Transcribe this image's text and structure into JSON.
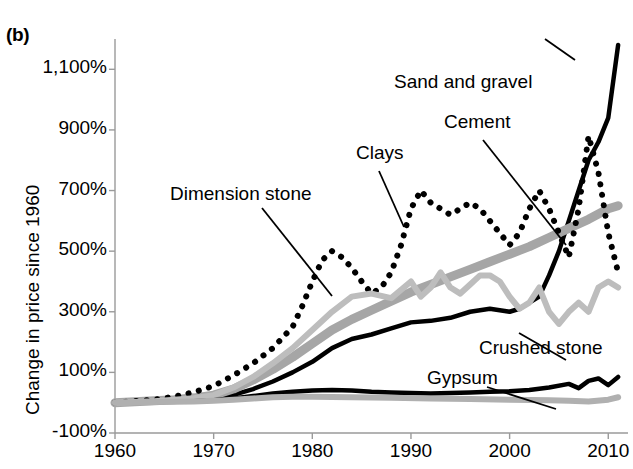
{
  "figure": {
    "panel_label": "(b)",
    "ylabel": "Change in price since 1960"
  },
  "chart_data": {
    "type": "line",
    "title": "",
    "xlabel": "",
    "ylabel": "Change in price since 1960",
    "xlim": [
      1960,
      2012
    ],
    "ylim": [
      -100,
      1200
    ],
    "yticks": [
      "-100%",
      "100%",
      "300%",
      "500%",
      "700%",
      "900%",
      "1,100%"
    ],
    "ytick_values": [
      -100,
      100,
      300,
      500,
      700,
      900,
      1100
    ],
    "xticks": [
      "1960",
      "1970",
      "1980",
      "1990",
      "2000",
      "2010"
    ],
    "xtick_values": [
      1960,
      1970,
      1980,
      1990,
      2000,
      2010
    ],
    "grid": false,
    "legend_position": "inline-annotations",
    "annotations": [
      {
        "text": "Dimension stone",
        "x_px": 170,
        "y_px": 196
      },
      {
        "text": "Clays",
        "x_px": 356,
        "y_px": 155
      },
      {
        "text": "Sand and gravel",
        "x_px": 394,
        "y_px": 84
      },
      {
        "text": "Cement",
        "x_px": 444,
        "y_px": 124
      },
      {
        "text": "Crushed stone",
        "x_px": 479,
        "y_px": 350
      },
      {
        "text": "Gypsum",
        "x_px": 427,
        "y_px": 380
      }
    ],
    "series": [
      {
        "name": "Cement",
        "style": "solid",
        "color": "#000000",
        "width": 4.5,
        "x": [
          1960,
          1962,
          1964,
          1966,
          1968,
          1970,
          1972,
          1974,
          1976,
          1978,
          1980,
          1982,
          1984,
          1986,
          1988,
          1990,
          1992,
          1994,
          1996,
          1998,
          2000,
          2001,
          2002,
          2003,
          2004,
          2005,
          2006,
          2007,
          2008,
          2009,
          2010,
          2011
        ],
        "values": [
          0,
          2,
          4,
          6,
          10,
          16,
          26,
          45,
          70,
          100,
          135,
          180,
          210,
          225,
          245,
          265,
          270,
          280,
          300,
          310,
          300,
          310,
          330,
          350,
          420,
          500,
          600,
          700,
          800,
          860,
          940,
          1180
        ]
      },
      {
        "name": "Sand and gravel",
        "style": "solid",
        "color": "#a6a6a6",
        "width": 9,
        "x": [
          1960,
          1962,
          1964,
          1966,
          1968,
          1970,
          1972,
          1974,
          1976,
          1978,
          1980,
          1982,
          1984,
          1986,
          1988,
          1990,
          1992,
          1994,
          1996,
          1998,
          2000,
          2002,
          2004,
          2006,
          2008,
          2010,
          2011
        ],
        "values": [
          0,
          3,
          6,
          10,
          16,
          25,
          45,
          75,
          110,
          150,
          195,
          240,
          275,
          305,
          335,
          365,
          390,
          415,
          440,
          465,
          490,
          515,
          545,
          575,
          605,
          640,
          650
        ]
      },
      {
        "name": "Clays",
        "style": "dotted",
        "color": "#000000",
        "width": 6,
        "x": [
          1960,
          1962,
          1964,
          1966,
          1968,
          1970,
          1972,
          1974,
          1976,
          1978,
          1979,
          1980,
          1981,
          1982,
          1983,
          1984,
          1985,
          1986,
          1987,
          1988,
          1989,
          1990,
          1991,
          1992,
          1993,
          1994,
          1995,
          1996,
          1997,
          1998,
          1999,
          2000,
          2001,
          2002,
          2003,
          2004,
          2005,
          2006,
          2007,
          2008,
          2009,
          2010,
          2011
        ],
        "values": [
          0,
          5,
          10,
          20,
          35,
          55,
          90,
          130,
          180,
          250,
          320,
          400,
          470,
          500,
          480,
          445,
          400,
          360,
          380,
          430,
          520,
          640,
          700,
          660,
          640,
          620,
          640,
          660,
          640,
          600,
          560,
          520,
          560,
          640,
          700,
          640,
          560,
          480,
          640,
          880,
          760,
          560,
          430
        ]
      },
      {
        "name": "Dimension stone",
        "style": "solid",
        "color": "#bdbdbd",
        "width": 6,
        "x": [
          1960,
          1964,
          1968,
          1970,
          1972,
          1974,
          1976,
          1978,
          1980,
          1982,
          1984,
          1986,
          1988,
          1990,
          1991,
          1992,
          1993,
          1994,
          1995,
          1996,
          1997,
          1998,
          1999,
          2000,
          2001,
          2002,
          2003,
          2004,
          2005,
          2006,
          2007,
          2008,
          2009,
          2010,
          2011
        ],
        "values": [
          0,
          5,
          15,
          25,
          50,
          85,
          130,
          180,
          240,
          300,
          350,
          360,
          345,
          400,
          350,
          380,
          430,
          380,
          360,
          390,
          420,
          420,
          400,
          350,
          310,
          330,
          380,
          300,
          260,
          300,
          330,
          300,
          380,
          400,
          380
        ]
      },
      {
        "name": "Crushed stone",
        "style": "solid",
        "color": "#000000",
        "width": 4.5,
        "x": [
          1960,
          1964,
          1968,
          1970,
          1972,
          1974,
          1976,
          1978,
          1980,
          1982,
          1984,
          1986,
          1988,
          1990,
          1992,
          1994,
          1996,
          1998,
          2000,
          2002,
          2004,
          2006,
          2007,
          2008,
          2009,
          2010,
          2011
        ],
        "values": [
          0,
          2,
          5,
          8,
          14,
          22,
          30,
          36,
          40,
          42,
          40,
          36,
          34,
          32,
          30,
          32,
          34,
          36,
          38,
          42,
          50,
          62,
          48,
          72,
          80,
          58,
          85
        ]
      },
      {
        "name": "Gypsum",
        "style": "solid",
        "color": "#b0b0b0",
        "width": 6,
        "x": [
          1960,
          1964,
          1968,
          1970,
          1972,
          1974,
          1976,
          1978,
          1980,
          1984,
          1988,
          1992,
          1996,
          2000,
          2004,
          2006,
          2008,
          2010,
          2011
        ],
        "values": [
          0,
          2,
          4,
          6,
          10,
          14,
          18,
          20,
          20,
          18,
          16,
          14,
          12,
          10,
          8,
          6,
          4,
          10,
          18
        ]
      }
    ]
  }
}
